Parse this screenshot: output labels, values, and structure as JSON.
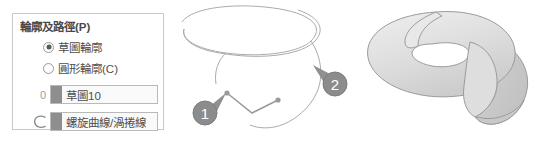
{
  "panel": {
    "title": "輪廓及路徑(P)",
    "radios": [
      {
        "label": "草圖輪廓",
        "checked": true,
        "name": "sketch-profile"
      },
      {
        "label": "圓形輪廓(C)",
        "checked": false,
        "name": "circular-profile"
      }
    ],
    "fields": [
      {
        "prefix_label": "0",
        "value": "草圖10",
        "swatch_color": "#8e8e8e",
        "name": "sketch-selection"
      },
      {
        "prefix_icon": "helix-curve-icon",
        "value": "螺旋曲線/渦捲線",
        "swatch_color": "#8e8e8e",
        "name": "path-selection"
      }
    ]
  },
  "graphics": {
    "wireframe": {
      "name": "helix-wireframe-preview",
      "callouts": [
        {
          "number": "1",
          "name": "callout-badge-1"
        },
        {
          "number": "2",
          "name": "callout-badge-2"
        }
      ],
      "line_color": "#a8a8a8",
      "badge_color": "#8c8c8c"
    },
    "solid": {
      "name": "helical-sweep-solid",
      "fill_top": "#e2e2e2",
      "fill_side": "#cfcfcf",
      "outline": "#9b9b9b"
    }
  }
}
